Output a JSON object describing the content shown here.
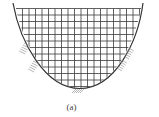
{
  "figure": {
    "caption": "(a)",
    "grid": {
      "spacing": 6.5,
      "top_y": 8.5,
      "left_x": 16,
      "right_x": 141,
      "color": "#3a3a3a"
    },
    "curve": {
      "color": "#333333",
      "shape": "parabolic-U"
    },
    "support_hatches": [
      {
        "x": 31,
        "y": 50,
        "side": "left"
      },
      {
        "x": 40,
        "y": 68,
        "side": "left"
      },
      {
        "x": 80,
        "y": 89,
        "side": "bottom"
      },
      {
        "x": 116,
        "y": 64,
        "side": "right"
      },
      {
        "x": 123,
        "y": 52,
        "side": "right"
      }
    ]
  }
}
